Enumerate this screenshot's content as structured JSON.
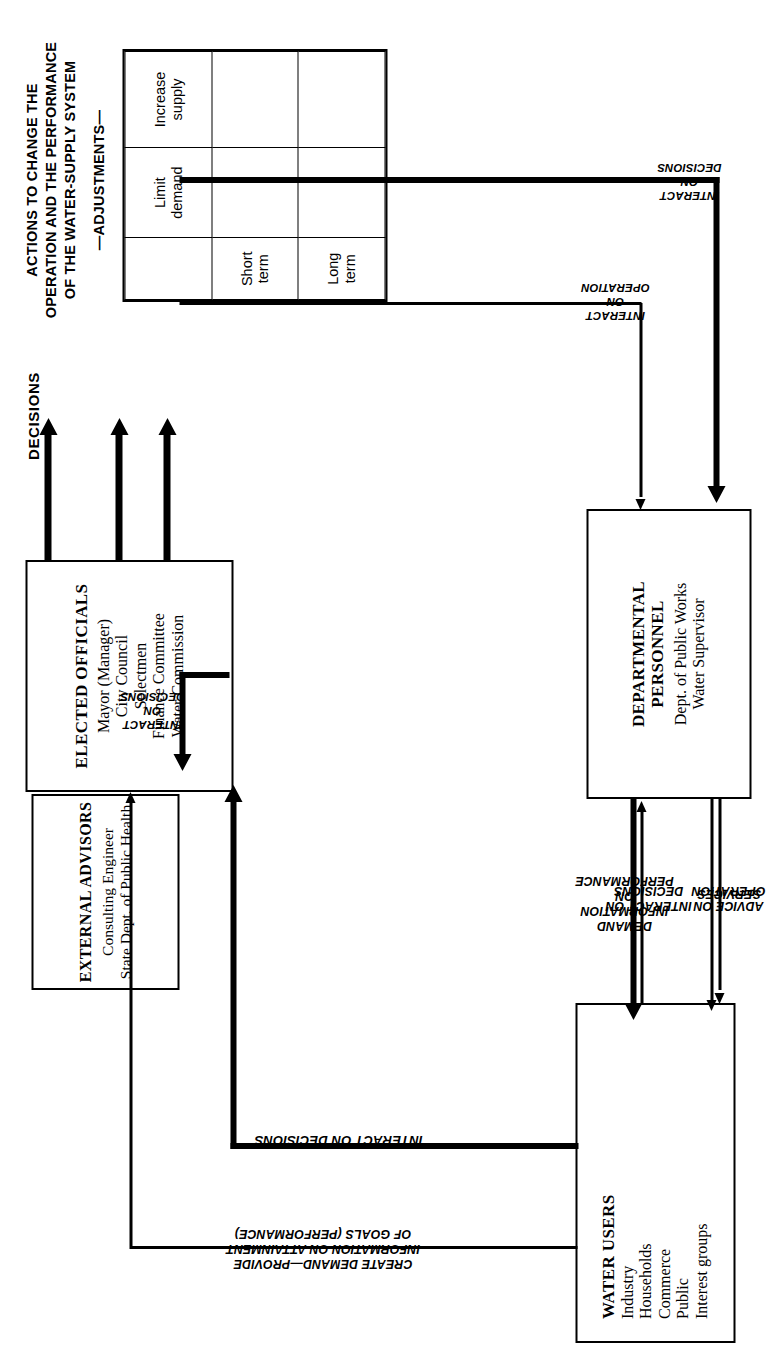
{
  "figure": {
    "headline_lines": [
      "ACTIONS TO CHANGE THE",
      "OPERATION AND THE PERFORMANCE",
      "OF THE WATER-SUPPLY SYSTEM"
    ],
    "adjustments_label": "—ADJUSTMENTS—",
    "decisions_label": "DECISIONS"
  },
  "matrix": {
    "corner": "",
    "col_headers": [
      "Limit\ndemand",
      "Increase\nsupply"
    ],
    "row_headers": [
      "Short\nterm",
      "Long\nterm"
    ],
    "cells": [
      [
        "",
        ""
      ],
      [
        "",
        ""
      ]
    ]
  },
  "boxes": {
    "elected_officials": {
      "title": "ELECTED OFFICIALS",
      "items": [
        "Mayor (Manager)",
        "City Council",
        "Selectmen",
        "Finance Committee",
        "Water Commission"
      ]
    },
    "external_advisors": {
      "title": "EXTERNAL ADVISORS",
      "items": [
        "Consulting Engineer",
        "State Dept. of Public Health"
      ]
    },
    "water_users": {
      "title": "WATER USERS",
      "items": [
        "Industry",
        "Households",
        "Commerce",
        "Public",
        "Interest groups"
      ]
    },
    "departmental_personnel": {
      "title_lines": [
        "DEPARTMENTAL",
        "PERSONNEL"
      ],
      "items": [
        "Dept. of Public Works",
        "Water Supervisor"
      ]
    }
  },
  "flow_labels": {
    "create_demand": "CREATE DEMAND—PROVIDE\nINFORMATION ON ATTAINMENT\nOF GOALS  (PERFORMANCE)",
    "users_interact_on_decisions": "INTERACT ON DECISIONS",
    "dept_interact_on_decisions": "INTERACT ON\nDECISIONS",
    "advice_on_operation": "ADVICE ON\nOPERATION",
    "advisors_interact_on_decisions": "INTERACT\nON\nDECISIONS",
    "demand_information": "DEMAND\nINFORMATION\nON\nPERFORMANCE",
    "services": "SERVICES",
    "interact_on_operation": "INTERACT\nON\nOPERATION",
    "advisors_dept_interact_on_decisions": "INTERACT\nON\nDECISIONS"
  },
  "colors": {
    "ink": "#000000",
    "paper": "#ffffff"
  }
}
